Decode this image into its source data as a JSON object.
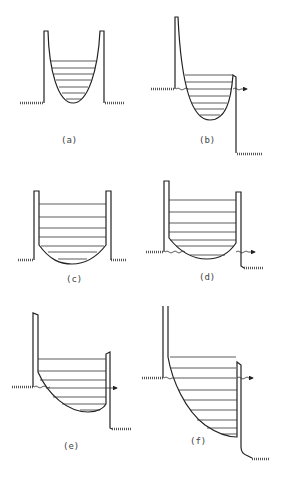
{
  "figure": {
    "panels": [
      {
        "id": "a",
        "label": "(a)",
        "shape": "parabolic well",
        "levels": 7,
        "tunneling": false
      },
      {
        "id": "b",
        "label": "(b)",
        "shape": "parabolic well under bias",
        "levels": 8,
        "tunneling": true
      },
      {
        "id": "c",
        "label": "(c)",
        "shape": "square well with rounded bottom",
        "levels": 7,
        "tunneling": false
      },
      {
        "id": "d",
        "label": "(d)",
        "shape": "square well with rounded bottom under bias",
        "levels": 7,
        "tunneling": true
      },
      {
        "id": "e",
        "label": "(e)",
        "shape": "tilted well under bias",
        "levels": 7,
        "tunneling": true
      },
      {
        "id": "f",
        "label": "(f)",
        "shape": "strongly tilted well under high bias",
        "levels": 9,
        "tunneling": true
      }
    ]
  },
  "labels": {
    "a": "(a)",
    "b": "(b)",
    "c": "(c)",
    "d": "(d)",
    "e": "(e)",
    "f": "(f)"
  },
  "colors": {
    "line": "#222222",
    "background": "#ffffff"
  }
}
